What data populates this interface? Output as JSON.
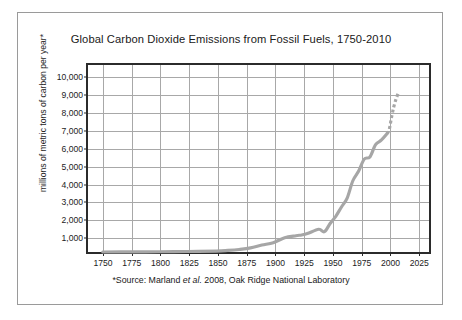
{
  "figure": {
    "title": "Global Carbon Dioxide Emissions from Fossil Fuels, 1750-2010",
    "source_note_prefix": "*Source: Marland ",
    "source_note_italic": "et al.",
    "source_note_suffix": " 2008, Oak Ridge National Laboratory"
  },
  "colors": {
    "curve": "#a6a6a6",
    "plot_border": "#2b2b2b",
    "gridline": "#a8a8a8",
    "frame": "#9a9a9a",
    "text": "#1c1c1c",
    "background": "#ffffff"
  },
  "chart_data": {
    "type": "line",
    "title": "Global Carbon Dioxide Emissions from Fossil Fuels, 1750-2010",
    "xlabel": "",
    "ylabel": "millions of metric tons of carbon per year*",
    "xlim": [
      1737,
      2037
    ],
    "ylim": [
      0,
      10700
    ],
    "grid": true,
    "legend": "none",
    "xticks": [
      1750,
      1775,
      1800,
      1825,
      1850,
      1875,
      1900,
      1925,
      1950,
      1975,
      2000,
      2025
    ],
    "xtick_labels": [
      "1750",
      "1775",
      "1800",
      "1825",
      "1850",
      "1875",
      "1900",
      "1925",
      "1950",
      "1975",
      "2000",
      "2025"
    ],
    "yticks": [
      1000,
      2000,
      3000,
      4000,
      5000,
      6000,
      7000,
      8000,
      9000,
      10000
    ],
    "ytick_labels": [
      "1,000",
      "2,000",
      "3,000",
      "4,000",
      "5,000",
      "6,000",
      "7,000",
      "8,000",
      "9,000",
      "10,000"
    ],
    "series": [
      {
        "name": "Global fossil fuel carbon emissions",
        "style": "solid",
        "x": [
          1750,
          1775,
          1800,
          1825,
          1850,
          1860,
          1870,
          1880,
          1890,
          1900,
          1910,
          1920,
          1925,
          1930,
          1940,
          1945,
          1950,
          1955,
          1960,
          1965,
          1970,
          1975,
          1980,
          1985,
          1990,
          1995,
          2000
        ],
        "y": [
          3,
          8,
          15,
          30,
          54,
          91,
          147,
          236,
          396,
          534,
          819,
          932,
          975,
          1053,
          1299,
          1160,
          1630,
          2043,
          2577,
          3087,
          4076,
          4615,
          5315,
          5441,
          6143,
          6395,
          6766
        ]
      },
      {
        "name": "Global fossil fuel carbon emissions (recent, dotted)",
        "style": "dotted",
        "x": [
          2000,
          2002,
          2004,
          2006,
          2008,
          2010
        ],
        "y": [
          6766,
          7000,
          7700,
          8300,
          8750,
          9100
        ]
      }
    ]
  },
  "axis": {
    "y_title": "millions of metric tons of carbon per year*"
  }
}
